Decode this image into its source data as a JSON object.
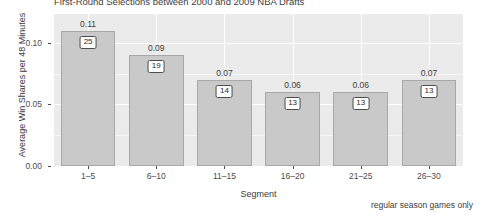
{
  "chart_data": {
    "type": "bar",
    "title": "First-Round Selections between 2000 and 2009 NBA Drafts",
    "xlabel": "Segment",
    "ylabel": "Average Win Shares per 48 Minutes",
    "caption": "regular season games only",
    "categories": [
      "1–5",
      "6–10",
      "11–15",
      "16–20",
      "21–25",
      "26–30"
    ],
    "values": [
      0.11,
      0.09,
      0.07,
      0.06,
      0.06,
      0.07
    ],
    "value_labels": [
      "0.11",
      "0.09",
      "0.07",
      "0.06",
      "0.06",
      "0.07"
    ],
    "counts": [
      25,
      19,
      14,
      13,
      13,
      13
    ],
    "count_labels": [
      "25",
      "19",
      "14",
      "13",
      "13",
      "13"
    ],
    "ylim": [
      0.0,
      0.1235
    ],
    "y_ticks": [
      0.0,
      0.05,
      0.1
    ],
    "y_tick_labels": [
      "0.00",
      "0.05",
      "0.10"
    ],
    "grid": true,
    "legend": "none",
    "bar_fill": "#c9c9c9",
    "bar_stroke": "#a8a8a8",
    "panel_background": "#ebebeb",
    "grid_color": "#ffffff"
  }
}
